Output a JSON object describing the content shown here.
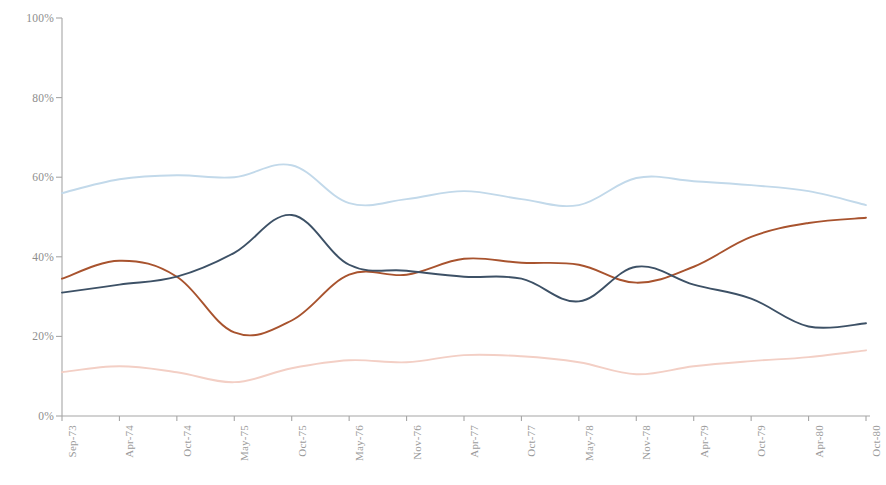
{
  "chart_data": {
    "type": "line",
    "title": "",
    "subtitle": "",
    "xlabel": "",
    "ylabel": "",
    "ylim": [
      0,
      100
    ],
    "ytick_labels": [
      "0%",
      "20%",
      "40%",
      "60%",
      "80%",
      "100%"
    ],
    "ytick_values": [
      0,
      20,
      40,
      60,
      80,
      100
    ],
    "grid": false,
    "legend": "none",
    "categories": [
      "Sep-73",
      "Apr-74",
      "Oct-74",
      "May-75",
      "Oct-75",
      "May-76",
      "Nov-76",
      "Apr-77",
      "Oct-77",
      "May-78",
      "Nov-78",
      "Apr-79",
      "Oct-79",
      "Apr-80",
      "Oct-80"
    ],
    "series": [
      {
        "name": "series-light-blue",
        "color": "#c2d9ea",
        "values": [
          56.0,
          59.5,
          60.5,
          60.0,
          63.0,
          53.5,
          54.5,
          56.5,
          54.5,
          53.0,
          59.8,
          59.0,
          58.0,
          56.5,
          53.0
        ]
      },
      {
        "name": "series-dark-blue",
        "color": "#3d5166",
        "values": [
          31.0,
          33.0,
          35.0,
          41.0,
          50.5,
          38.0,
          36.5,
          35.0,
          34.5,
          28.8,
          37.5,
          33.0,
          29.5,
          22.5,
          23.3
        ]
      },
      {
        "name": "series-brown",
        "color": "#a8532e",
        "values": [
          34.5,
          39.0,
          35.0,
          21.0,
          24.0,
          35.5,
          35.5,
          39.5,
          38.5,
          38.0,
          33.5,
          37.5,
          45.0,
          48.5,
          49.8
        ]
      },
      {
        "name": "series-light-pink",
        "color": "#f3cfc5",
        "values": [
          11.0,
          12.5,
          11.0,
          8.5,
          12.0,
          14.0,
          13.5,
          15.3,
          15.0,
          13.5,
          10.5,
          12.5,
          13.8,
          14.8,
          16.5
        ]
      }
    ],
    "axis_color": "#a6a6a6"
  }
}
